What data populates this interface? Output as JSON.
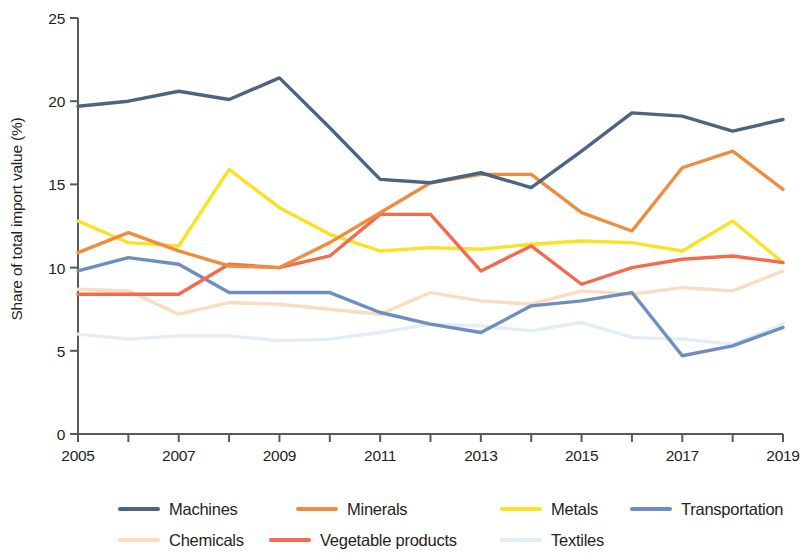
{
  "chart_data": {
    "type": "line",
    "title": "",
    "xlabel": "",
    "ylabel": "Share of total import value (%)",
    "xlim": [
      2005,
      2019
    ],
    "ylim": [
      0,
      25
    ],
    "yticks": [
      0,
      5,
      10,
      15,
      20,
      25
    ],
    "xticks": [
      2005,
      2006,
      2007,
      2008,
      2009,
      2010,
      2011,
      2012,
      2013,
      2014,
      2015,
      2016,
      2017,
      2018,
      2019
    ],
    "xtick_labels": [
      "2005",
      "",
      "2007",
      "",
      "2009",
      "",
      "2011",
      "",
      "2013",
      "",
      "2015",
      "",
      "2017",
      "",
      "2019"
    ],
    "ytick_labels": [
      "0",
      "5",
      "10",
      "15",
      "20",
      "25"
    ],
    "grid": false,
    "legend_position": "bottom",
    "x": [
      2005,
      2006,
      2007,
      2008,
      2009,
      2010,
      2011,
      2012,
      2013,
      2014,
      2015,
      2016,
      2017,
      2018,
      2019
    ],
    "series": [
      {
        "name": "Machines",
        "color": "#4d6480",
        "values": [
          19.7,
          20.0,
          20.6,
          20.1,
          21.4,
          18.4,
          15.3,
          15.1,
          15.7,
          14.8,
          17.0,
          19.3,
          19.1,
          18.2,
          18.9
        ]
      },
      {
        "name": "Minerals",
        "color": "#ee8d3f",
        "values": [
          10.9,
          12.1,
          11.0,
          10.1,
          10.0,
          11.5,
          13.3,
          15.1,
          15.6,
          15.6,
          13.3,
          12.2,
          16.0,
          17.0,
          14.7
        ]
      },
      {
        "name": "Metals",
        "color": "#fae222",
        "values": [
          12.8,
          11.5,
          11.3,
          15.9,
          13.6,
          12.0,
          11.0,
          11.2,
          11.1,
          11.4,
          11.6,
          11.5,
          11.0,
          12.8,
          10.3
        ]
      },
      {
        "name": "Transportation",
        "color": "#6d8ebf",
        "values": [
          9.8,
          10.6,
          10.2,
          8.5,
          8.5,
          8.5,
          7.3,
          6.6,
          6.1,
          7.7,
          8.0,
          8.5,
          4.7,
          5.3,
          6.4
        ]
      },
      {
        "name": "Chemicals",
        "color": "#fadcc0",
        "values": [
          8.7,
          8.6,
          7.2,
          7.9,
          7.8,
          7.5,
          7.2,
          8.5,
          8.0,
          7.8,
          8.6,
          8.4,
          8.8,
          8.6,
          9.8
        ]
      },
      {
        "name": "Vegetable products",
        "color": "#f26b4e",
        "values": [
          8.4,
          8.4,
          8.4,
          10.2,
          10.0,
          10.7,
          13.2,
          13.2,
          9.8,
          11.3,
          9.0,
          10.0,
          10.5,
          10.7,
          10.3
        ]
      },
      {
        "name": "Textiles",
        "color": "#e3edf5",
        "values": [
          6.0,
          5.7,
          5.9,
          5.9,
          5.6,
          5.7,
          6.1,
          6.6,
          6.5,
          6.2,
          6.7,
          5.8,
          5.7,
          5.4,
          6.6
        ]
      }
    ]
  },
  "axes": {
    "y_title": "Share of total import value (%)",
    "y_tick_labels": [
      "0",
      "5",
      "10",
      "15",
      "20",
      "25"
    ],
    "x_tick_labels": [
      "2005",
      "2007",
      "2009",
      "2011",
      "2013",
      "2015",
      "2017",
      "2019"
    ]
  },
  "legend": {
    "row1": [
      {
        "label": "Machines",
        "color": "#4d6480"
      },
      {
        "label": "Minerals",
        "color": "#ee8d3f"
      },
      {
        "label": "Metals",
        "color": "#fae222"
      },
      {
        "label": "Transportation",
        "color": "#6d8ebf"
      }
    ],
    "row2": [
      {
        "label": "Chemicals",
        "color": "#fadcc0"
      },
      {
        "label": "Vegetable products",
        "color": "#f26b4e"
      },
      {
        "label": "Textiles",
        "color": "#e3edf5"
      }
    ]
  }
}
